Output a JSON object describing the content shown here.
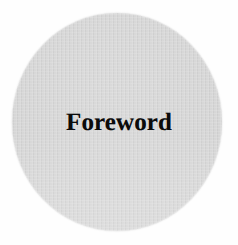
{
  "page": {
    "background_color": "#fefefe",
    "width": 238,
    "height": 245
  },
  "graphic": {
    "shape_name": "gray-circle",
    "fill_color": "#d2d2d2",
    "edge_color": "#c9c9c9"
  },
  "heading": {
    "text": "Foreword",
    "color": "#0b0b0b"
  }
}
